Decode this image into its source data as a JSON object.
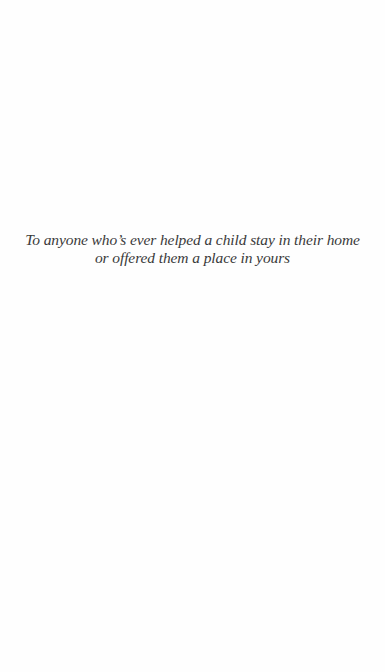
{
  "page": {
    "type": "dedication",
    "background": "#fefefe",
    "text_color": "#3a3a3a"
  },
  "dedication": {
    "lines": [
      "To anyone who’s ever helped a child stay in their home",
      "or offered them a place in yours"
    ]
  }
}
